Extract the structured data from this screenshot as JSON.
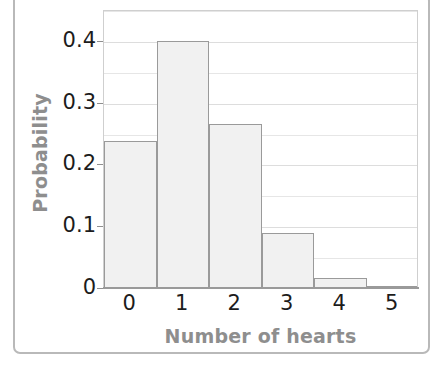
{
  "chart_data": {
    "type": "bar",
    "title": "",
    "xlabel": "Number of hearts",
    "ylabel": "Probability",
    "categories": [
      "0",
      "1",
      "2",
      "3",
      "4",
      "5"
    ],
    "values": [
      0.236,
      0.398,
      0.264,
      0.088,
      0.015,
      0.001
    ],
    "ylim": [
      0,
      0.45
    ],
    "xlim": [
      -0.5,
      5.5
    ],
    "ytick_labels": [
      "0",
      "0.1",
      "0.2",
      "0.3",
      "0.4"
    ],
    "ytick_values": [
      0,
      0.1,
      0.2,
      0.3,
      0.4
    ],
    "minor_gridline_values": [
      0.05,
      0.15,
      0.25,
      0.35,
      0.45
    ],
    "grid": true,
    "legend": false,
    "legend_position": "none"
  },
  "style": {
    "bar_fill": "#f1f1f1",
    "bar_edge": "#9a9a9a",
    "gridline_major": "#dddddd",
    "gridline_minor": "#e6e6e6",
    "plot_border": "#cfcfcf",
    "axis_line": "#9a9a9a",
    "tick_text": "#1c1c1c",
    "axis_title_text": "#8e8e8e",
    "frame_border": "#b9b9b9",
    "background": "#ffffff"
  }
}
